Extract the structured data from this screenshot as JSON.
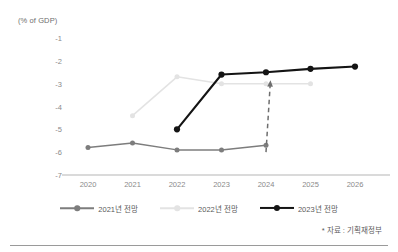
{
  "chart_data": {
    "type": "line",
    "title": "",
    "subtitle": "",
    "xlabel": "",
    "ylabel": "(% of GDP)",
    "unit_label": "(% of GDP)",
    "categories": [
      "2020",
      "2021",
      "2022",
      "2023",
      "2024",
      "2025",
      "2026"
    ],
    "x": [
      2020,
      2021,
      2022,
      2023,
      2024,
      2025,
      2026
    ],
    "ylim": [
      -7,
      -1
    ],
    "yticks": [
      -1,
      -2,
      -3,
      -4,
      -5,
      -6,
      -7
    ],
    "ytick_labels": [
      "-1",
      "-2",
      "-3",
      "-4",
      "-5",
      "-6",
      "-7"
    ],
    "grid": false,
    "legend_position": "bottom",
    "series": [
      {
        "name": "2021년 전망",
        "color": "#7d7d7d",
        "x": [
          2020,
          2021,
          2022,
          2023,
          2024
        ],
        "values": [
          -5.8,
          -5.6,
          -5.9,
          -5.9,
          -5.7
        ]
      },
      {
        "name": "2022년 전망",
        "color": "#e3e3e3",
        "x": [
          2021,
          2022,
          2023,
          2024,
          2025
        ],
        "values": [
          -4.4,
          -2.7,
          -3.0,
          -3.0,
          -3.0
        ]
      },
      {
        "name": "2023년 전망",
        "color": "#141414",
        "x": [
          2022,
          2023,
          2024,
          2025,
          2026
        ],
        "values": [
          -5.0,
          -2.6,
          -2.5,
          -2.35,
          -2.25
        ]
      }
    ],
    "annotations": [
      {
        "type": "arrow",
        "style": "dashed",
        "color": "#6e6e6e",
        "from": {
          "x": 2024,
          "y": -6.0
        },
        "to": {
          "x": 2024.1,
          "y": -2.85
        }
      }
    ]
  },
  "source": {
    "note": "* 자료 : 기획재정부"
  },
  "legend": {
    "items": [
      {
        "label": "2021년 전망",
        "color": "#7d7d7d"
      },
      {
        "label": "2022년 전망",
        "color": "#e3e3e3"
      },
      {
        "label": "2023년 전망",
        "color": "#141414"
      }
    ]
  }
}
